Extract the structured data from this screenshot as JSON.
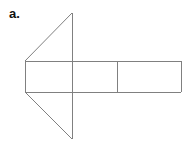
{
  "figure": {
    "label": "a.",
    "caption_letter": "a",
    "background_color": "#ffffff",
    "line_color": "#808080",
    "label_color": "#111111",
    "canvas": {
      "width": 195,
      "height": 148
    },
    "parts": [
      {
        "name": "triangle",
        "kind": "triangle",
        "vertices": [
          {
            "x": 72,
            "y": 13
          },
          {
            "x": 25,
            "y": 61
          },
          {
            "x": 72,
            "y": 139
          }
        ]
      },
      {
        "name": "left-rectangle",
        "kind": "rectangle",
        "x": 25,
        "y": 61,
        "width": 92,
        "height": 31
      },
      {
        "name": "right-rectangle",
        "kind": "rectangle",
        "x": 117,
        "y": 61,
        "width": 64,
        "height": 31
      }
    ],
    "segments": [
      {
        "name": "triangle-upper-slant",
        "x1": 25,
        "y1": 61,
        "x2": 72,
        "y2": 13
      },
      {
        "name": "triangle-lower-slant",
        "x1": 25,
        "y1": 92,
        "x2": 72,
        "y2": 139
      },
      {
        "name": "triangle-vertical-edge",
        "x1": 72,
        "y1": 13,
        "x2": 72,
        "y2": 139
      },
      {
        "name": "rectangle-top-edge",
        "x1": 25,
        "y1": 61,
        "x2": 181,
        "y2": 61
      },
      {
        "name": "rectangle-bottom-edge",
        "x1": 25,
        "y1": 92,
        "x2": 181,
        "y2": 92
      },
      {
        "name": "rectangle-left-edge",
        "x1": 25,
        "y1": 61,
        "x2": 25,
        "y2": 92
      },
      {
        "name": "rectangle-right-edge",
        "x1": 181,
        "y1": 61,
        "x2": 181,
        "y2": 92
      },
      {
        "name": "rectangle-divider",
        "x1": 117,
        "y1": 61,
        "x2": 117,
        "y2": 92
      }
    ]
  }
}
